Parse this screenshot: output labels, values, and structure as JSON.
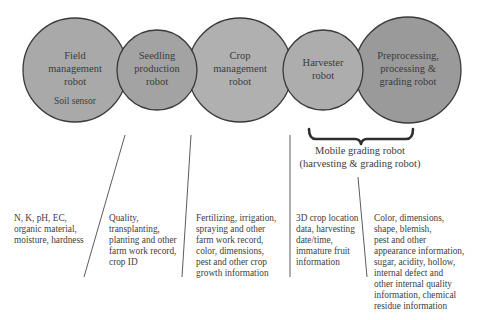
{
  "robots": [
    {
      "id": "field",
      "title_lines": [
        "Field",
        "management",
        "robot"
      ],
      "sub": "Soil sensor",
      "fill": "#a9a9a9"
    },
    {
      "id": "seedling",
      "title_lines": [
        "Seedling",
        "production",
        "robot"
      ],
      "fill": "#a3a3a3"
    },
    {
      "id": "crop",
      "title_lines": [
        "Crop",
        "management",
        "robot"
      ],
      "fill": "#b0b0b0"
    },
    {
      "id": "harvester",
      "title_lines": [
        "Harvester",
        "robot"
      ],
      "fill": "#adadad"
    },
    {
      "id": "preprocessing",
      "title_lines": [
        "Preprocessing,",
        "processing &",
        "grading robot"
      ],
      "fill": "#9a9a9a"
    }
  ],
  "brace": {
    "line1": "Mobile grading robot",
    "line2": "(harvesting & grading robot)"
  },
  "info": [
    {
      "id": "field",
      "lines": [
        "N, K, pH, EC,",
        "organic material,",
        "moisture, hardness"
      ]
    },
    {
      "id": "seedling",
      "lines": [
        "Quality,",
        "transplanting,",
        "planting and other",
        "farm work record,",
        "crop ID"
      ]
    },
    {
      "id": "crop",
      "lines": [
        "Fertilizing, irrigation,",
        "spraying and other",
        "farm work record,",
        "color, dimensions,",
        "pest and other crop",
        "growth information"
      ]
    },
    {
      "id": "harvester",
      "lines": [
        "3D crop location",
        "data, harvesting",
        "date/time,",
        "immature fruit",
        "information"
      ]
    },
    {
      "id": "preprocessing",
      "lines": [
        "Color, dimensions,",
        "shape, blemish,",
        "pest and other",
        "appearance information,",
        "sugar, acidity, hollow,",
        "internal defect and",
        "other internal quality",
        "information, chemical",
        "residue information"
      ]
    }
  ],
  "colors": {
    "stroke": "#3a3a3a",
    "text": "#3c3c3c",
    "background": "#ffffff"
  }
}
